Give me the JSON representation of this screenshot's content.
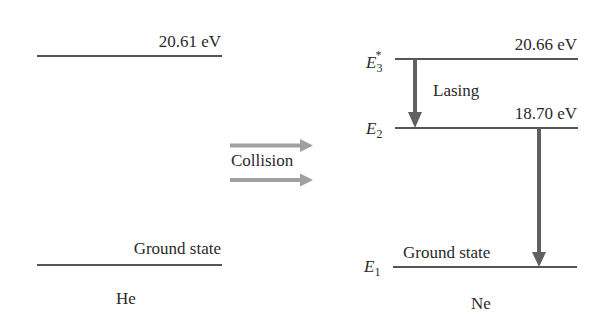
{
  "diagram": {
    "helium": {
      "atom_label": "He",
      "levels": [
        {
          "name": "excited",
          "energy_label": "20.61 eV"
        },
        {
          "name": "ground",
          "energy_label": "Ground state"
        }
      ]
    },
    "collision": {
      "label": "Collision",
      "arrow_color": "#a0a0a0"
    },
    "neon": {
      "atom_label": "Ne",
      "levels": [
        {
          "symbol": "E",
          "subscript": "3",
          "superscript": "*",
          "energy_label": "20.66 eV"
        },
        {
          "symbol": "E",
          "subscript": "2",
          "superscript": "",
          "energy_label": "18.70 eV"
        },
        {
          "symbol": "E",
          "subscript": "1",
          "superscript": "",
          "energy_label": "Ground state"
        }
      ],
      "transitions": [
        {
          "from": "E3*",
          "to": "E2",
          "label": "Lasing"
        },
        {
          "from": "E2",
          "to": "E1",
          "label": ""
        }
      ],
      "arrow_color": "#606060"
    },
    "line_color": "#555555"
  }
}
